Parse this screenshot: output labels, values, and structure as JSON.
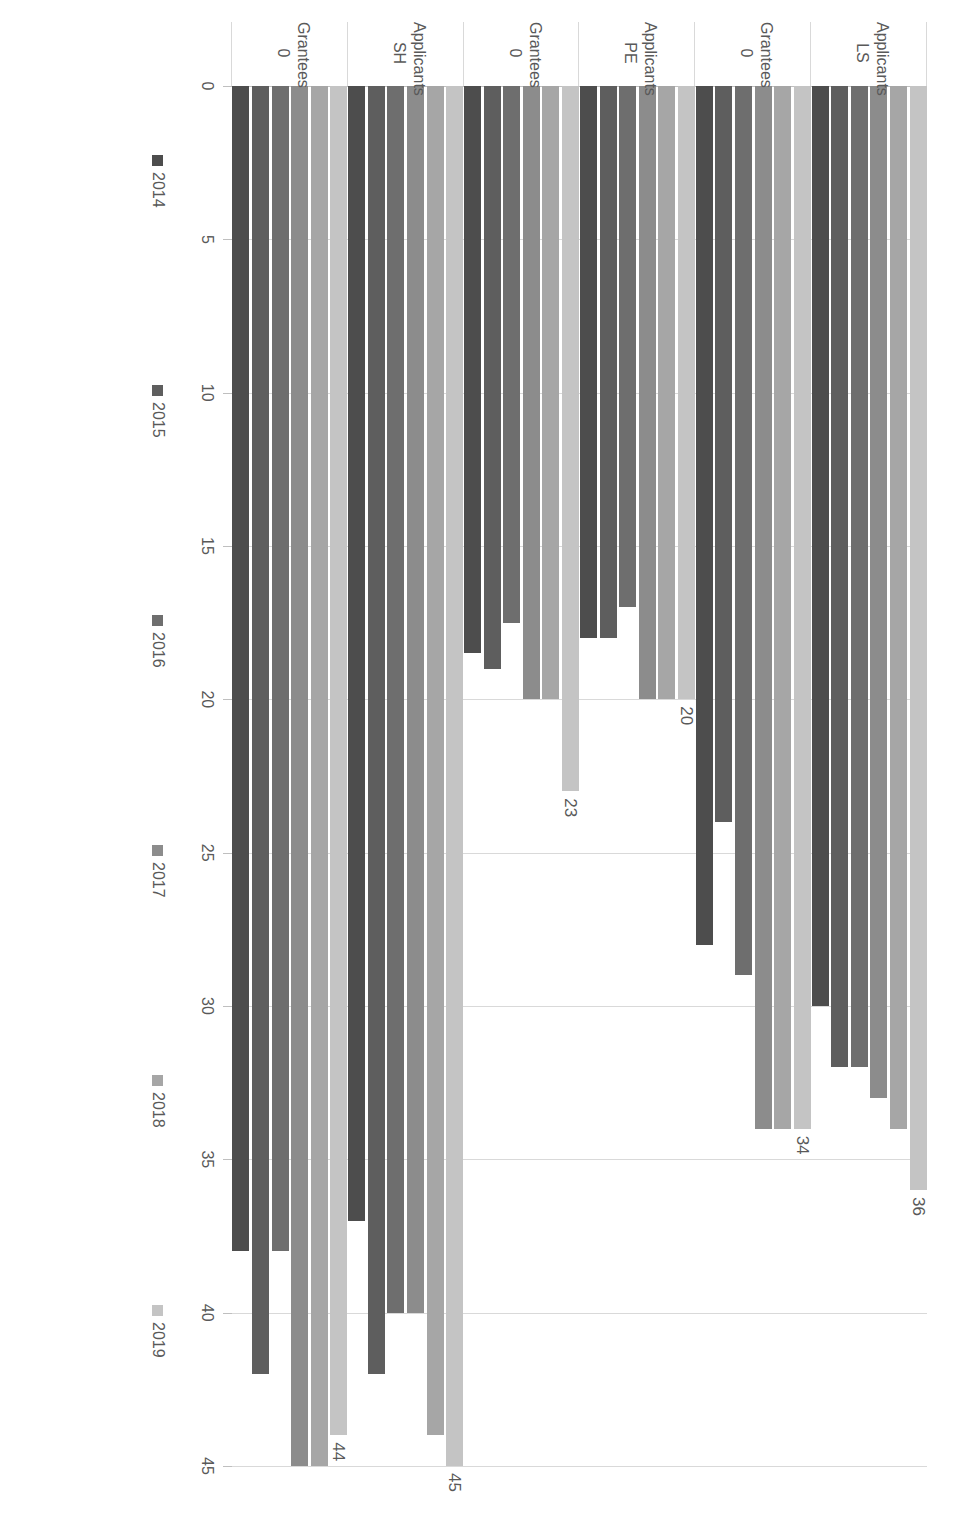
{
  "chart_data": {
    "type": "bar",
    "orientation": "horizontal-rotated",
    "title": "",
    "xlabel": "",
    "ylabel": "",
    "value_axis_ticks": [
      0,
      5,
      10,
      15,
      20,
      25,
      30,
      35,
      40,
      45
    ],
    "ylim": [
      0,
      45
    ],
    "grid": true,
    "legend_position": "bottom",
    "categories": [
      {
        "main": "Applicants",
        "sub": "LS"
      },
      {
        "main": "Grantees",
        "sub": "0"
      },
      {
        "main": "Applicants",
        "sub": "PE"
      },
      {
        "main": "Grantees",
        "sub": "0"
      },
      {
        "main": "Applicants",
        "sub": "SH"
      },
      {
        "main": "Grantees",
        "sub": "0"
      }
    ],
    "series": [
      {
        "name": "2014",
        "color": "#4d4d4d",
        "values": [
          30,
          28,
          18,
          18.5,
          37,
          38
        ]
      },
      {
        "name": "2015",
        "color": "#5e5e5e",
        "values": [
          32,
          24,
          18,
          19,
          42,
          42
        ]
      },
      {
        "name": "2016",
        "color": "#6e6e6e",
        "values": [
          32,
          29,
          17,
          17.5,
          40,
          38
        ]
      },
      {
        "name": "2017",
        "color": "#8c8c8c",
        "values": [
          33,
          34,
          20,
          20,
          40,
          45
        ]
      },
      {
        "name": "2018",
        "color": "#a6a6a6",
        "values": [
          34,
          34,
          20,
          20,
          44,
          45
        ]
      },
      {
        "name": "2019",
        "color": "#c4c4c4",
        "values": [
          36,
          34,
          20,
          23,
          45,
          44
        ]
      }
    ],
    "data_labels": [
      {
        "category_index": 0,
        "series": "2019",
        "text": "36"
      },
      {
        "category_index": 1,
        "series": "2019",
        "text": "34"
      },
      {
        "category_index": 2,
        "series": "2019",
        "text": "20"
      },
      {
        "category_index": 3,
        "series": "2019",
        "text": "23"
      },
      {
        "category_index": 4,
        "series": "2019",
        "text": "45"
      },
      {
        "category_index": 5,
        "series": "2019",
        "text": "44"
      }
    ]
  }
}
